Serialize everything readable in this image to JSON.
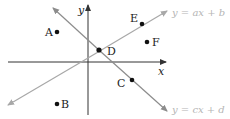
{
  "diagram": {
    "axes": {
      "x_label": "x",
      "y_label": "y",
      "color": "#333333"
    },
    "lines": [
      {
        "name": "line-ax-b",
        "label": "y = ax + b",
        "color": "#a8a8a8"
      },
      {
        "name": "line-cx-d",
        "label": "y = cx + d",
        "color": "#8c8c8c"
      }
    ],
    "points": [
      {
        "label": "A"
      },
      {
        "label": "B"
      },
      {
        "label": "C"
      },
      {
        "label": "D"
      },
      {
        "label": "E"
      },
      {
        "label": "F"
      }
    ],
    "point_color": "#111111"
  }
}
